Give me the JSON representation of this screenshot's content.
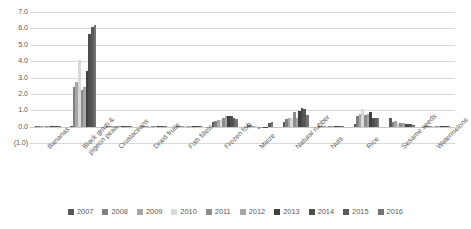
{
  "chart_data": {
    "type": "bar",
    "title": "",
    "subtitle": "",
    "xlabel": "",
    "ylabel": "",
    "ylim": [
      -1.0,
      7.0
    ],
    "ytick_labels": [
      "7.0",
      "6.0",
      "5.0",
      "4.0",
      "3.0",
      "2.0",
      "1.0",
      "0.0",
      "(1.0)"
    ],
    "ytick_values": [
      7.0,
      6.0,
      5.0,
      4.0,
      3.0,
      2.0,
      1.0,
      0.0,
      -1.0
    ],
    "grid": true,
    "legend_position": "bottom",
    "categories": [
      "Bananas",
      "Black gram & pigeon peas",
      "Crustaceans",
      "Dried fruits",
      "Fish fillets",
      "Frozen fish",
      "Maize",
      "Natural rubber",
      "Nuts",
      "Rice",
      "Sesame seeds",
      "Watermelons"
    ],
    "series": [
      {
        "name": "2007",
        "color": "#595959",
        "values": [
          0.02,
          0.0,
          0.0,
          0.02,
          0.03,
          0.3,
          0.1,
          0.3,
          0.02,
          0.15,
          0.55,
          0.05
        ]
      },
      {
        "name": "2008",
        "color": "#7f7f7f",
        "values": [
          0.02,
          2.45,
          0.0,
          0.03,
          0.04,
          0.33,
          0.12,
          0.45,
          0.02,
          0.65,
          0.3,
          0.06
        ]
      },
      {
        "name": "2009",
        "color": "#a6a6a6",
        "values": [
          0.03,
          2.7,
          0.0,
          0.03,
          0.04,
          0.38,
          0.03,
          0.55,
          0.02,
          0.8,
          0.35,
          0.05
        ]
      },
      {
        "name": "2010",
        "color": "#d9d9d9",
        "values": [
          0.03,
          4.05,
          0.0,
          0.03,
          0.05,
          0.42,
          0.02,
          0.55,
          0.02,
          1.05,
          0.22,
          0.05
        ]
      },
      {
        "name": "2011",
        "color": "#8c8c8c",
        "values": [
          0.03,
          2.25,
          0.0,
          0.04,
          0.05,
          0.55,
          -0.15,
          0.9,
          0.02,
          0.7,
          0.25,
          0.06
        ]
      },
      {
        "name": "2012",
        "color": "#a6a6a6",
        "values": [
          0.03,
          2.4,
          0.0,
          0.04,
          0.05,
          0.62,
          -0.05,
          0.55,
          0.03,
          0.75,
          0.2,
          0.05
        ]
      },
      {
        "name": "2013",
        "color": "#404040",
        "values": [
          0.03,
          3.4,
          0.0,
          0.04,
          0.05,
          0.62,
          -0.05,
          0.95,
          0.03,
          0.9,
          0.18,
          0.05
        ]
      },
      {
        "name": "2014",
        "color": "#4d4d4d",
        "values": [
          0.03,
          5.65,
          0.0,
          0.05,
          0.05,
          0.65,
          -0.03,
          1.15,
          0.03,
          0.55,
          0.16,
          0.05
        ]
      },
      {
        "name": "2015",
        "color": "#595959",
        "values": [
          0.03,
          6.1,
          0.0,
          0.05,
          0.05,
          0.55,
          0.25,
          1.1,
          0.03,
          0.5,
          0.15,
          0.05
        ]
      },
      {
        "name": "2016",
        "color": "#737373",
        "values": [
          0.03,
          6.2,
          0.0,
          0.05,
          0.06,
          0.45,
          0.28,
          0.7,
          0.03,
          0.5,
          0.12,
          0.04
        ]
      }
    ]
  },
  "legend": {
    "items": [
      {
        "label": "2007"
      },
      {
        "label": "2008"
      },
      {
        "label": "2009"
      },
      {
        "label": "2010"
      },
      {
        "label": "2011"
      },
      {
        "label": "2012"
      },
      {
        "label": "2013"
      },
      {
        "label": "2014"
      },
      {
        "label": "2015"
      },
      {
        "label": "2016"
      }
    ]
  },
  "colors": {
    "gridline": "#d9d9d9",
    "axis_text": "#595959",
    "background": "#ffffff"
  }
}
